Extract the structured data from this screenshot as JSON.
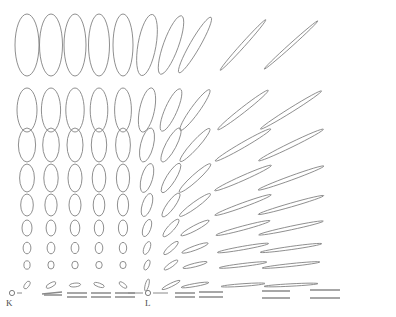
{
  "figure": {
    "kind": "tissot-indicatrix-grid",
    "width": 396,
    "height": 317,
    "background_color": "#ffffff",
    "stroke_color": "#7b7b7b",
    "baseline_color": "#8a8a8a"
  },
  "labels": {
    "left_marker": "K",
    "right_marker": "L"
  },
  "chart_data": {
    "type": "scatter",
    "xlabel": "",
    "ylabel": "",
    "grid": false,
    "legend": null,
    "annotations": [
      {
        "text": "K",
        "x": 27,
        "y": 303
      },
      {
        "text": "L",
        "x": 148,
        "y": 303
      }
    ],
    "columns_x": [
      27,
      51,
      75,
      99,
      123,
      147,
      171,
      195,
      243,
      291
    ],
    "rows_y": [
      45,
      110,
      145,
      178,
      205,
      228,
      248,
      265,
      287
    ],
    "row_heights": [
      62,
      42,
      34,
      28,
      23,
      17,
      12,
      8,
      3
    ],
    "column_tilt_deg": [
      0,
      0,
      0,
      0,
      0,
      8,
      20,
      32,
      45,
      52
    ],
    "column_elongation": [
      1.0,
      1.05,
      1.12,
      1.22,
      1.38,
      1.7,
      2.4,
      3.4,
      7.5,
      11.0
    ],
    "ellipses": [
      {
        "cx": 27,
        "cy": 45,
        "rx": 12,
        "ry": 31,
        "rot": 0
      },
      {
        "cx": 51,
        "cy": 45,
        "rx": 11.5,
        "ry": 31,
        "rot": 0
      },
      {
        "cx": 75,
        "cy": 45,
        "rx": 11,
        "ry": 31,
        "rot": 0
      },
      {
        "cx": 99,
        "cy": 45,
        "rx": 10.5,
        "ry": 31,
        "rot": 0
      },
      {
        "cx": 123,
        "cy": 45,
        "rx": 10,
        "ry": 31,
        "rot": 0
      },
      {
        "cx": 147,
        "cy": 45,
        "rx": 9,
        "ry": 31,
        "rot": 10
      },
      {
        "cx": 171,
        "cy": 45,
        "rx": 7.5,
        "ry": 31,
        "rot": 20
      },
      {
        "cx": 195,
        "cy": 45,
        "rx": 5,
        "ry": 32,
        "rot": 30
      },
      {
        "cx": 243,
        "cy": 45,
        "rx": 2,
        "ry": 34,
        "rot": 42
      },
      {
        "cx": 291,
        "cy": 45,
        "rx": 1.6,
        "ry": 36,
        "rot": 48
      },
      {
        "cx": 27,
        "cy": 110,
        "rx": 10,
        "ry": 22,
        "rot": 0
      },
      {
        "cx": 51,
        "cy": 110,
        "rx": 9.6,
        "ry": 22,
        "rot": 0
      },
      {
        "cx": 75,
        "cy": 110,
        "rx": 9.2,
        "ry": 22,
        "rot": 0
      },
      {
        "cx": 99,
        "cy": 110,
        "rx": 8.8,
        "ry": 22,
        "rot": 0
      },
      {
        "cx": 123,
        "cy": 110,
        "rx": 8.4,
        "ry": 22,
        "rot": 0
      },
      {
        "cx": 147,
        "cy": 110,
        "rx": 7.4,
        "ry": 22.5,
        "rot": 12
      },
      {
        "cx": 171,
        "cy": 110,
        "rx": 6,
        "ry": 23,
        "rot": 24
      },
      {
        "cx": 195,
        "cy": 110,
        "rx": 4.2,
        "ry": 25,
        "rot": 36
      },
      {
        "cx": 243,
        "cy": 110,
        "rx": 2.6,
        "ry": 32,
        "rot": 52
      },
      {
        "cx": 291,
        "cy": 110,
        "rx": 2.2,
        "ry": 36,
        "rot": 58
      },
      {
        "cx": 27,
        "cy": 145,
        "rx": 8.6,
        "ry": 17,
        "rot": 0
      },
      {
        "cx": 51,
        "cy": 145,
        "rx": 8.3,
        "ry": 17,
        "rot": 0
      },
      {
        "cx": 75,
        "cy": 145,
        "rx": 8,
        "ry": 17,
        "rot": 0
      },
      {
        "cx": 99,
        "cy": 145,
        "rx": 7.7,
        "ry": 17,
        "rot": 0
      },
      {
        "cx": 123,
        "cy": 145,
        "rx": 7.4,
        "ry": 17,
        "rot": 0
      },
      {
        "cx": 147,
        "cy": 145,
        "rx": 6.4,
        "ry": 17.5,
        "rot": 14
      },
      {
        "cx": 171,
        "cy": 145,
        "rx": 5.2,
        "ry": 19,
        "rot": 28
      },
      {
        "cx": 195,
        "cy": 145,
        "rx": 3.8,
        "ry": 22,
        "rot": 42
      },
      {
        "cx": 243,
        "cy": 145,
        "rx": 2.6,
        "ry": 32,
        "rot": 60
      },
      {
        "cx": 291,
        "cy": 145,
        "rx": 2.3,
        "ry": 36,
        "rot": 64
      },
      {
        "cx": 27,
        "cy": 178,
        "rx": 7.4,
        "ry": 14,
        "rot": 0
      },
      {
        "cx": 51,
        "cy": 178,
        "rx": 7.2,
        "ry": 14,
        "rot": 0
      },
      {
        "cx": 75,
        "cy": 178,
        "rx": 7,
        "ry": 14,
        "rot": 0
      },
      {
        "cx": 99,
        "cy": 178,
        "rx": 6.8,
        "ry": 14,
        "rot": 0
      },
      {
        "cx": 123,
        "cy": 178,
        "rx": 6.6,
        "ry": 14,
        "rot": 0
      },
      {
        "cx": 147,
        "cy": 178,
        "rx": 5.6,
        "ry": 15,
        "rot": 16
      },
      {
        "cx": 171,
        "cy": 178,
        "rx": 4.6,
        "ry": 17,
        "rot": 32
      },
      {
        "cx": 195,
        "cy": 178,
        "rx": 3.4,
        "ry": 21,
        "rot": 48
      },
      {
        "cx": 243,
        "cy": 178,
        "rx": 2.4,
        "ry": 31,
        "rot": 66
      },
      {
        "cx": 291,
        "cy": 178,
        "rx": 2.1,
        "ry": 35,
        "rot": 70
      },
      {
        "cx": 27,
        "cy": 205,
        "rx": 6.3,
        "ry": 11,
        "rot": 0
      },
      {
        "cx": 51,
        "cy": 205,
        "rx": 6.1,
        "ry": 11,
        "rot": 0
      },
      {
        "cx": 75,
        "cy": 205,
        "rx": 6,
        "ry": 11,
        "rot": 0
      },
      {
        "cx": 99,
        "cy": 205,
        "rx": 5.8,
        "ry": 11,
        "rot": 0
      },
      {
        "cx": 123,
        "cy": 205,
        "rx": 5.6,
        "ry": 11,
        "rot": 0
      },
      {
        "cx": 147,
        "cy": 205,
        "rx": 4.7,
        "ry": 12,
        "rot": 18
      },
      {
        "cx": 171,
        "cy": 205,
        "rx": 3.9,
        "ry": 14.5,
        "rot": 36
      },
      {
        "cx": 195,
        "cy": 205,
        "rx": 3,
        "ry": 19,
        "rot": 54
      },
      {
        "cx": 243,
        "cy": 205,
        "rx": 2.2,
        "ry": 30,
        "rot": 70
      },
      {
        "cx": 291,
        "cy": 205,
        "rx": 1.9,
        "ry": 34,
        "rot": 74
      },
      {
        "cx": 27,
        "cy": 228,
        "rx": 5,
        "ry": 8,
        "rot": 0
      },
      {
        "cx": 51,
        "cy": 228,
        "rx": 4.9,
        "ry": 8,
        "rot": 0
      },
      {
        "cx": 75,
        "cy": 228,
        "rx": 4.8,
        "ry": 8,
        "rot": 0
      },
      {
        "cx": 99,
        "cy": 228,
        "rx": 4.7,
        "ry": 8,
        "rot": 0
      },
      {
        "cx": 123,
        "cy": 228,
        "rx": 4.6,
        "ry": 8,
        "rot": 0
      },
      {
        "cx": 147,
        "cy": 228,
        "rx": 3.8,
        "ry": 9,
        "rot": 20
      },
      {
        "cx": 171,
        "cy": 228,
        "rx": 3.2,
        "ry": 11.5,
        "rot": 42
      },
      {
        "cx": 195,
        "cy": 228,
        "rx": 2.6,
        "ry": 16,
        "rot": 62
      },
      {
        "cx": 243,
        "cy": 228,
        "rx": 2,
        "ry": 28,
        "rot": 75
      },
      {
        "cx": 291,
        "cy": 228,
        "rx": 1.8,
        "ry": 33,
        "rot": 78
      },
      {
        "cx": 27,
        "cy": 248,
        "rx": 3.9,
        "ry": 5.8,
        "rot": 0
      },
      {
        "cx": 51,
        "cy": 248,
        "rx": 3.9,
        "ry": 5.8,
        "rot": 0
      },
      {
        "cx": 75,
        "cy": 248,
        "rx": 3.9,
        "ry": 5.6,
        "rot": 0
      },
      {
        "cx": 99,
        "cy": 248,
        "rx": 3.8,
        "ry": 5.6,
        "rot": 0
      },
      {
        "cx": 123,
        "cy": 248,
        "rx": 3.7,
        "ry": 5.6,
        "rot": 0
      },
      {
        "cx": 147,
        "cy": 248,
        "rx": 3,
        "ry": 6.8,
        "rot": 22
      },
      {
        "cx": 171,
        "cy": 248,
        "rx": 2.6,
        "ry": 9.5,
        "rot": 48
      },
      {
        "cx": 195,
        "cy": 248,
        "rx": 2.2,
        "ry": 14,
        "rot": 70
      },
      {
        "cx": 243,
        "cy": 248,
        "rx": 1.7,
        "ry": 26,
        "rot": 80
      },
      {
        "cx": 291,
        "cy": 248,
        "rx": 1.6,
        "ry": 31,
        "rot": 82
      },
      {
        "cx": 27,
        "cy": 265,
        "rx": 3.1,
        "ry": 4.2,
        "rot": 0
      },
      {
        "cx": 51,
        "cy": 265,
        "rx": 3.1,
        "ry": 4,
        "rot": 0
      },
      {
        "cx": 75,
        "cy": 265,
        "rx": 3.2,
        "ry": 3.8,
        "rot": 0
      },
      {
        "cx": 99,
        "cy": 265,
        "rx": 3.2,
        "ry": 3.6,
        "rot": 0
      },
      {
        "cx": 123,
        "cy": 265,
        "rx": 3.1,
        "ry": 3.6,
        "rot": 0
      },
      {
        "cx": 147,
        "cy": 265,
        "rx": 2.4,
        "ry": 5.4,
        "rot": 24
      },
      {
        "cx": 171,
        "cy": 265,
        "rx": 2.1,
        "ry": 8.2,
        "rot": 55
      },
      {
        "cx": 195,
        "cy": 265,
        "rx": 1.8,
        "ry": 12.5,
        "rot": 76
      },
      {
        "cx": 243,
        "cy": 265,
        "rx": 1.5,
        "ry": 24,
        "rot": 83
      },
      {
        "cx": 291,
        "cy": 265,
        "rx": 1.4,
        "ry": 29,
        "rot": 84
      },
      {
        "cx": 27,
        "cy": 285,
        "rx": 2.2,
        "ry": 4.4,
        "rot": 34
      },
      {
        "cx": 51,
        "cy": 285,
        "rx": 2.1,
        "ry": 5.4,
        "rot": 62
      },
      {
        "cx": 75,
        "cy": 285,
        "rx": 1.9,
        "ry": 5.6,
        "rot": 84
      },
      {
        "cx": 99,
        "cy": 285,
        "rx": 1.9,
        "ry": 5.4,
        "rot": 108
      },
      {
        "cx": 123,
        "cy": 285,
        "rx": 1.9,
        "ry": 4.6,
        "rot": 126
      },
      {
        "cx": 147,
        "cy": 285,
        "rx": 1.8,
        "ry": 6.2,
        "rot": 15
      },
      {
        "cx": 171,
        "cy": 285,
        "rx": 1.7,
        "ry": 10,
        "rot": 64
      },
      {
        "cx": 195,
        "cy": 285,
        "rx": 1.5,
        "ry": 14,
        "rot": 80
      },
      {
        "cx": 243,
        "cy": 285,
        "rx": 1.3,
        "ry": 22,
        "rot": 86
      },
      {
        "cx": 291,
        "cy": 285,
        "rx": 1.2,
        "ry": 27,
        "rot": 87
      }
    ],
    "baseline_segments": [
      {
        "x1": 44,
        "y1": 295,
        "x2": 62,
        "y2": 295
      },
      {
        "x1": 42,
        "y1": 294,
        "x2": 62,
        "y2": 292
      },
      {
        "x1": 67,
        "y1": 293,
        "x2": 87,
        "y2": 293
      },
      {
        "x1": 67,
        "y1": 297,
        "x2": 87,
        "y2": 297
      },
      {
        "x1": 91,
        "y1": 293,
        "x2": 111,
        "y2": 293
      },
      {
        "x1": 91,
        "y1": 297,
        "x2": 111,
        "y2": 297
      },
      {
        "x1": 115,
        "y1": 293,
        "x2": 135,
        "y2": 293
      },
      {
        "x1": 115,
        "y1": 297,
        "x2": 135,
        "y2": 297
      },
      {
        "x1": 175,
        "y1": 293,
        "x2": 195,
        "y2": 293
      },
      {
        "x1": 175,
        "y1": 297,
        "x2": 195,
        "y2": 297
      },
      {
        "x1": 199,
        "y1": 292,
        "x2": 223,
        "y2": 292
      },
      {
        "x1": 199,
        "y1": 297,
        "x2": 223,
        "y2": 297
      },
      {
        "x1": 262,
        "y1": 291,
        "x2": 290,
        "y2": 291
      },
      {
        "x1": 262,
        "y1": 298,
        "x2": 290,
        "y2": 298
      },
      {
        "x1": 310,
        "y1": 290,
        "x2": 340,
        "y2": 290
      },
      {
        "x1": 310,
        "y1": 298,
        "x2": 340,
        "y2": 298
      }
    ],
    "markers": [
      {
        "name": "K",
        "dot_x": 12,
        "dot_y": 293,
        "dot_r": 2.6,
        "tick_left": null,
        "tick_right": {
          "x1": 17,
          "y1": 293,
          "x2": 22,
          "y2": 293
        }
      },
      {
        "name": "L",
        "dot_x": 148,
        "dot_y": 293,
        "dot_r": 2.6,
        "tick_left": {
          "x1": 128,
          "y1": 293,
          "x2": 143,
          "y2": 293
        },
        "tick_right": {
          "x1": 153,
          "y1": 293,
          "x2": 168,
          "y2": 293
        }
      }
    ]
  }
}
